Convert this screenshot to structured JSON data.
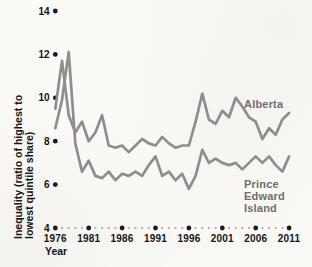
{
  "colors": {
    "series_line": "#8e8e8e",
    "series_label": "#6e6e6e",
    "axis_dot": "#1c1c1c",
    "minor_dot": "#b4b4b4",
    "text": "#161616",
    "background": "#fbfaf7"
  },
  "chart_data": {
    "type": "line",
    "title": "",
    "xlabel": "Year",
    "ylabel": "Inequality (ratio of highest to lowest quintile share)",
    "ylabel_line1": "Inequality (ratio of highest to",
    "ylabel_line2": "lowest quintile share)",
    "ylim": [
      4,
      14
    ],
    "yticks": [
      4,
      6,
      8,
      10,
      12,
      14
    ],
    "xticks": [
      1976,
      1981,
      1986,
      1991,
      1996,
      2001,
      2006,
      2011
    ],
    "grid": "dotted-baseline-only",
    "legend_position": "labels-on-chart",
    "x": [
      1976,
      1977,
      1978,
      1979,
      1980,
      1981,
      1982,
      1983,
      1984,
      1985,
      1986,
      1987,
      1988,
      1989,
      1990,
      1991,
      1992,
      1993,
      1994,
      1995,
      1996,
      1997,
      1998,
      1999,
      2000,
      2001,
      2002,
      2003,
      2004,
      2005,
      2006,
      2007,
      2008,
      2009,
      2010,
      2011
    ],
    "series": [
      {
        "name": "Alberta",
        "values": [
          9.5,
          11.7,
          9.2,
          8.4,
          8.9,
          8.0,
          8.4,
          9.2,
          7.8,
          7.7,
          7.8,
          7.5,
          7.8,
          8.1,
          7.9,
          7.8,
          8.2,
          7.9,
          7.7,
          7.8,
          7.8,
          8.9,
          10.2,
          9.0,
          8.8,
          9.4,
          9.1,
          10.0,
          9.6,
          9.1,
          8.9,
          8.1,
          8.6,
          8.3,
          9.0,
          9.3
        ]
      },
      {
        "name": "Prince Edward Island",
        "label_lines": [
          "Prince",
          "Edward",
          "Island"
        ],
        "values": [
          8.6,
          9.9,
          12.1,
          7.9,
          6.6,
          7.1,
          6.4,
          6.3,
          6.6,
          6.2,
          6.5,
          6.4,
          6.6,
          6.4,
          6.9,
          7.3,
          6.4,
          6.6,
          6.2,
          6.5,
          5.8,
          6.4,
          7.6,
          7.0,
          7.2,
          7.0,
          6.9,
          7.0,
          6.7,
          7.0,
          7.3,
          7.0,
          7.3,
          6.9,
          6.6,
          7.3
        ]
      }
    ]
  }
}
